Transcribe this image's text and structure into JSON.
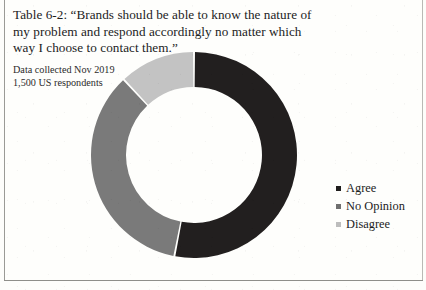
{
  "figure": {
    "caption": "Table 6-2: “Brands should be able to know the nature of my problem and respond accordingly no matter which way I choose to contact them.”",
    "note_line1": "Data collected Nov 2019",
    "note_line2": "1,500 US respondents"
  },
  "chart_data": {
    "type": "pie",
    "variant": "donut",
    "title": "Brands should be able to know the nature of my problem and respond accordingly no matter which way I choose to contact them.",
    "subtitle": "Data collected Nov 2019 — 1,500 US respondents",
    "categories": [
      "Agree",
      "No Opinion",
      "Disagree"
    ],
    "values": [
      53,
      35,
      12
    ],
    "unit": "percent",
    "colors": [
      "#221f1f",
      "#7a7a7a",
      "#c3c3c3"
    ],
    "start_angle_deg": 0,
    "direction": "clockwise",
    "inner_radius_ratio": 0.66,
    "legend_position": "right",
    "grid": false,
    "data_labels": false,
    "slices": [
      {
        "label": "Agree",
        "value": 53,
        "color": "#221f1f",
        "start_deg": 0,
        "end_deg": 191
      },
      {
        "label": "No Opinion",
        "value": 35,
        "color": "#7a7a7a",
        "start_deg": 191,
        "end_deg": 317
      },
      {
        "label": "Disagree",
        "value": 12,
        "color": "#c3c3c3",
        "start_deg": 317,
        "end_deg": 360
      }
    ]
  },
  "legend": {
    "items": [
      {
        "label": "Agree",
        "color": "#1f1d1d",
        "marker": "square-marker"
      },
      {
        "label": "No Opinion",
        "color": "#6f6f6f",
        "marker": "square-marker"
      },
      {
        "label": "Disagree",
        "color": "#bdbdbd",
        "marker": "square-marker"
      }
    ]
  }
}
